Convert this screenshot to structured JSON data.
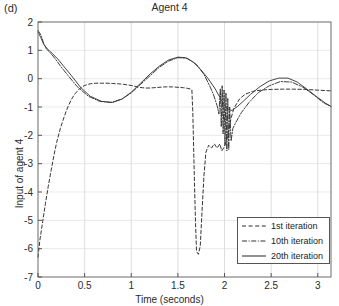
{
  "figure": {
    "panel_label": "(d)",
    "title": "Agent 4",
    "xlabel": "Time (seconds)",
    "ylabel": "Input of agent 4"
  },
  "legend": {
    "items": [
      {
        "label": "1st iteration",
        "style": "dashed"
      },
      {
        "label": "10th iteration",
        "style": "dashdot"
      },
      {
        "label": "20th iteration",
        "style": "solid"
      }
    ]
  },
  "chart_data": {
    "type": "line",
    "title": "Agent 4",
    "xlabel": "Time (seconds)",
    "ylabel": "Input of agent 4",
    "xlim": [
      0,
      3.1416
    ],
    "ylim": [
      -7,
      2
    ],
    "xticks": [
      0,
      0.5,
      1,
      1.5,
      2,
      2.5,
      3
    ],
    "xticklabels": [
      "0",
      "0.5",
      "1",
      "1.5",
      "2",
      "2.5",
      "3"
    ],
    "yticks": [
      -7,
      -6,
      -5,
      -4,
      -3,
      -2,
      -1,
      0,
      1,
      2
    ],
    "yticklabels": [
      "-7",
      "-6",
      "-5",
      "-4",
      "-3",
      "-2",
      "-1",
      "0",
      "1",
      "2"
    ],
    "grid": true,
    "legend_position": "lower right",
    "series": [
      {
        "name": "1st iteration",
        "style": "dashed",
        "color": "#2a2a2a",
        "x": [
          0.0,
          0.02,
          0.05,
          0.08,
          0.11,
          0.14,
          0.17,
          0.2,
          0.24,
          0.28,
          0.32,
          0.36,
          0.4,
          0.45,
          0.5,
          0.56,
          0.62,
          0.68,
          0.74,
          0.8,
          0.86,
          0.92,
          0.96,
          1.0,
          1.04,
          1.08,
          1.12,
          1.16,
          1.2,
          1.24,
          1.28,
          1.32,
          1.36,
          1.4,
          1.44,
          1.48,
          1.52,
          1.56,
          1.6,
          1.63,
          1.65,
          1.66,
          1.67,
          1.68,
          1.69,
          1.7,
          1.72,
          1.74,
          1.76,
          1.78,
          1.8,
          1.83,
          1.86,
          1.89,
          1.92,
          1.95,
          1.97,
          1.99,
          2.01,
          2.04,
          2.07,
          2.1,
          2.16,
          2.22,
          2.3,
          2.4,
          2.5,
          2.62,
          2.74,
          2.86,
          2.98,
          3.08,
          3.1416
        ],
        "y": [
          -6.3,
          -5.7,
          -5.05,
          -4.4,
          -3.8,
          -3.25,
          -2.72,
          -2.25,
          -1.75,
          -1.35,
          -1.0,
          -0.72,
          -0.52,
          -0.34,
          -0.24,
          -0.18,
          -0.16,
          -0.16,
          -0.16,
          -0.17,
          -0.18,
          -0.2,
          -0.22,
          -0.24,
          -0.27,
          -0.3,
          -0.32,
          -0.33,
          -0.33,
          -0.32,
          -0.31,
          -0.3,
          -0.29,
          -0.29,
          -0.29,
          -0.3,
          -0.31,
          -0.32,
          -0.34,
          -0.36,
          -0.4,
          -1.2,
          -2.6,
          -4.0,
          -5.2,
          -6.1,
          -6.2,
          -5.9,
          -4.6,
          -3.4,
          -2.6,
          -2.35,
          -2.45,
          -2.3,
          -2.45,
          -2.3,
          -2.55,
          -2.45,
          -2.3,
          -1.9,
          -1.4,
          -1.05,
          -0.72,
          -0.55,
          -0.45,
          -0.4,
          -0.38,
          -0.37,
          -0.37,
          -0.38,
          -0.4,
          -0.42,
          -0.43
        ]
      },
      {
        "name": "10th iteration",
        "style": "dashdot",
        "color": "#333333",
        "x": [
          0.0,
          0.03,
          0.06,
          0.09,
          0.13,
          0.18,
          0.24,
          0.32,
          0.42,
          0.54,
          0.66,
          0.78,
          0.9,
          1.0,
          1.1,
          1.2,
          1.3,
          1.4,
          1.5,
          1.6,
          1.7,
          1.78,
          1.84,
          1.88,
          1.92,
          1.94,
          1.955,
          1.965,
          1.975,
          1.985,
          1.995,
          2.005,
          2.015,
          2.025,
          2.035,
          2.045,
          2.055,
          2.07,
          2.09,
          2.12,
          2.18,
          2.26,
          2.36,
          2.48,
          2.6,
          2.72,
          2.84,
          2.96,
          3.06,
          3.1416
        ],
        "y": [
          1.7,
          1.55,
          1.25,
          1.05,
          0.92,
          0.72,
          0.45,
          0.12,
          -0.28,
          -0.62,
          -0.8,
          -0.84,
          -0.72,
          -0.5,
          -0.2,
          0.1,
          0.4,
          0.62,
          0.74,
          0.72,
          0.5,
          0.15,
          -0.25,
          -0.55,
          -0.95,
          -1.25,
          -0.35,
          -1.7,
          -0.25,
          -1.95,
          -0.4,
          -2.35,
          -0.5,
          -2.55,
          -0.7,
          -2.5,
          -1.0,
          -2.2,
          -1.75,
          -1.55,
          -1.2,
          -0.85,
          -0.5,
          -0.25,
          -0.1,
          -0.12,
          -0.3,
          -0.58,
          -0.85,
          -0.98
        ]
      },
      {
        "name": "20th iteration",
        "style": "solid",
        "color": "#3a3a3a",
        "x": [
          0.0,
          0.03,
          0.06,
          0.1,
          0.15,
          0.21,
          0.28,
          0.36,
          0.46,
          0.56,
          0.68,
          0.8,
          0.9,
          1.0,
          1.1,
          1.2,
          1.3,
          1.4,
          1.5,
          1.58,
          1.66,
          1.74,
          1.82,
          1.9,
          1.96,
          2.0,
          2.04,
          2.08,
          2.14,
          2.2,
          2.28,
          2.38,
          2.48,
          2.58,
          2.68,
          2.78,
          2.88,
          2.98,
          3.08,
          3.1416
        ],
        "y": [
          1.65,
          1.45,
          1.22,
          1.05,
          0.9,
          0.7,
          0.42,
          0.1,
          -0.32,
          -0.62,
          -0.8,
          -0.84,
          -0.72,
          -0.48,
          -0.16,
          0.16,
          0.44,
          0.66,
          0.76,
          0.74,
          0.6,
          0.34,
          0.02,
          -0.36,
          -0.72,
          -0.95,
          -1.1,
          -1.12,
          -0.98,
          -0.8,
          -0.55,
          -0.28,
          -0.08,
          0.02,
          0.02,
          -0.12,
          -0.36,
          -0.62,
          -0.86,
          -0.98
        ]
      }
    ]
  }
}
